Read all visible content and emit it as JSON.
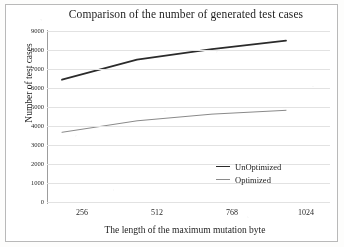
{
  "chart_data": {
    "type": "line",
    "title": "Comparison of the number of generated test cases",
    "xlabel": "The length of the maximum mutation byte",
    "ylabel": "Number of test cases",
    "categories": [
      "256",
      "512",
      "768",
      "1024"
    ],
    "x": [
      256,
      512,
      768,
      1024
    ],
    "series": [
      {
        "name": "UnOptimized",
        "values": [
          6450,
          7500,
          8050,
          8500
        ],
        "color": "#2b2b2b",
        "width": 1.8
      },
      {
        "name": "Optimized",
        "values": [
          3700,
          4300,
          4650,
          4850
        ],
        "color": "#8a8a8a",
        "width": 1.0
      }
    ],
    "ylim": [
      0,
      9000
    ],
    "yticks": [
      9000,
      8000,
      7000,
      6000,
      5000,
      4000,
      3000,
      2000,
      1000,
      0
    ],
    "ytick_labels": [
      "9000",
      "8000",
      "7000",
      "6000",
      "5000",
      "4000",
      "3000",
      "2000",
      "1000",
      "0"
    ],
    "grid": true,
    "grid_axis": "y",
    "legend_position": "lower right",
    "background": "#ffffff",
    "grid_color": "#e2e2e2",
    "axis_color": "#9d9d9d"
  },
  "legend": {
    "items": [
      {
        "label": "UnOptimized"
      },
      {
        "label": "Optimized"
      }
    ]
  },
  "yticks": {
    "t0": "9000",
    "t1": "8000",
    "t2": "7000",
    "t3": "6000",
    "t4": "5000",
    "t5": "4000",
    "t6": "3000",
    "t7": "2000",
    "t8": "1000",
    "t9": "0"
  },
  "xticks": {
    "t0": "256",
    "t1": "512",
    "t2": "768",
    "t3": "1024"
  }
}
